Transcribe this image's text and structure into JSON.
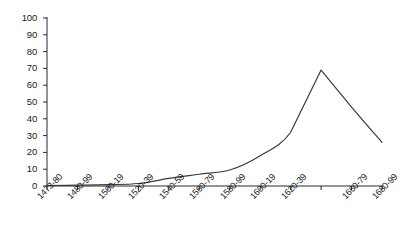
{
  "chart_data": {
    "type": "line",
    "title": "",
    "subtitle": "",
    "xlabel": "",
    "ylabel": "",
    "ylim": [
      0,
      100
    ],
    "ytick_values": [
      0,
      10,
      20,
      30,
      40,
      50,
      60,
      70,
      80,
      90,
      100
    ],
    "ytick_labels": [
      "0",
      "10",
      "20",
      "30",
      "40",
      "50",
      "60",
      "70",
      "80",
      "90",
      "100"
    ],
    "categories": [
      "1473-80",
      "1480-99",
      "1500-19",
      "1520-39",
      "1540-59",
      "1560-79",
      "1580-99",
      "1600-19",
      "1620-39",
      "",
      "1660-79",
      "1680-99"
    ],
    "xtick_labels_visible": [
      "1473-80",
      "1480-99",
      "1500-19",
      "1520-39",
      "1540-59",
      "1560-79",
      "1580-99",
      "1600-19",
      "1620-39",
      "1660-79",
      "1680-99"
    ],
    "values": [
      0.3,
      0.5,
      0.8,
      1.5,
      4.5,
      7,
      9.5,
      18,
      32,
      69,
      47,
      26
    ],
    "grid": false,
    "legend": false,
    "legend_position": "none",
    "line_color": "#3a3a3a",
    "line_width": 1.2,
    "markers": false,
    "axis_color": "#2b2b2b",
    "background": "#ffffff",
    "series": [
      {
        "name": "series-1",
        "values": [
          0.3,
          0.5,
          0.8,
          1.5,
          4.5,
          7,
          9.5,
          18,
          32,
          69,
          47,
          26
        ]
      }
    ]
  },
  "geometry": {
    "plot_left": 47,
    "plot_right": 382,
    "plot_top": 18,
    "plot_bottom": 186
  }
}
